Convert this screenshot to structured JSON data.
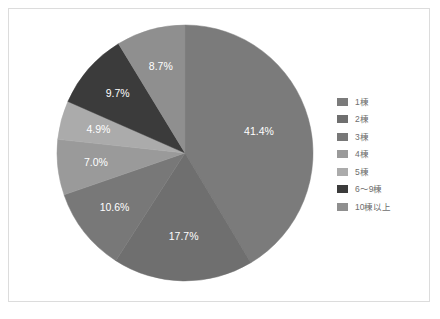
{
  "chart_data": {
    "type": "pie",
    "title": "",
    "xlabel": "",
    "ylabel": "",
    "legend_position": "right",
    "grid": false,
    "start_angle_deg": 0,
    "direction": "clockwise",
    "categories": [
      "1棟",
      "2棟",
      "3棟",
      "4棟",
      "5棟",
      "6〜9棟",
      "10棟以上"
    ],
    "values": [
      41.4,
      17.7,
      10.6,
      7.0,
      4.9,
      9.7,
      8.7
    ],
    "value_unit": "%",
    "data_labels": [
      "41.4%",
      "17.7%",
      "10.6%",
      "7.0%",
      "4.9%",
      "9.7%",
      "8.7%"
    ],
    "colors": [
      "#7b7b7b",
      "#6f6f6f",
      "#787878",
      "#9a9a9a",
      "#ababab",
      "#3b3b3b",
      "#8f8f8f"
    ],
    "slices": [
      {
        "label": "1棟",
        "value": 41.4,
        "data_label": "41.4%",
        "color": "#7b7b7b"
      },
      {
        "label": "2棟",
        "value": 17.7,
        "data_label": "17.7%",
        "color": "#6f6f6f"
      },
      {
        "label": "3棟",
        "value": 10.6,
        "data_label": "10.6%",
        "color": "#787878"
      },
      {
        "label": "4棟",
        "value": 7.0,
        "data_label": "7.0%",
        "color": "#9a9a9a"
      },
      {
        "label": "5棟",
        "value": 4.9,
        "data_label": "4.9%",
        "color": "#ababab"
      },
      {
        "label": "6〜9棟",
        "value": 9.7,
        "data_label": "9.7%",
        "color": "#3b3b3b"
      },
      {
        "label": "10棟以上",
        "value": 8.7,
        "data_label": "8.7%",
        "color": "#8f8f8f"
      }
    ]
  },
  "legend": {
    "items": [
      {
        "label": "1棟",
        "color": "#7b7b7b"
      },
      {
        "label": "2棟",
        "color": "#6f6f6f"
      },
      {
        "label": "3棟",
        "color": "#787878"
      },
      {
        "label": "4棟",
        "color": "#9a9a9a"
      },
      {
        "label": "5棟",
        "color": "#ababab"
      },
      {
        "label": "6〜9棟",
        "color": "#3b3b3b"
      },
      {
        "label": "10棟以上",
        "color": "#8f8f8f"
      }
    ]
  }
}
